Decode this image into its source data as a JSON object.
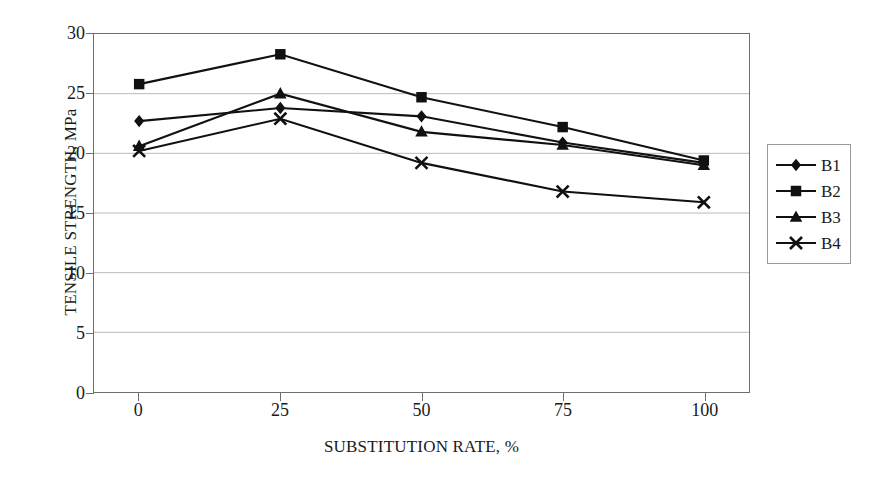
{
  "chart_data": {
    "type": "line",
    "title": "",
    "xlabel": "SUBSTITUTION RATE, %",
    "ylabel": "TENSILE STRENGTH, MPa",
    "x": [
      0,
      25,
      50,
      75,
      100
    ],
    "xticklabels": [
      "0",
      "25",
      "50",
      "75",
      "100"
    ],
    "yticklabels": [
      "0",
      "5",
      "10",
      "15",
      "20",
      "25",
      "30"
    ],
    "yticks": [
      0,
      5,
      10,
      15,
      20,
      25,
      30
    ],
    "xlim": [
      -8,
      108
    ],
    "ylim": [
      0,
      30
    ],
    "grid": "horizontal",
    "legend_position": "right-outside",
    "series": [
      {
        "name": "B1",
        "marker": "diamond",
        "values": [
          22.7,
          23.8,
          23.1,
          20.9,
          19.2
        ]
      },
      {
        "name": "B2",
        "marker": "square",
        "values": [
          25.8,
          28.3,
          24.7,
          22.2,
          19.4
        ]
      },
      {
        "name": "B3",
        "marker": "triangle",
        "values": [
          20.6,
          25.0,
          21.8,
          20.7,
          19.0
        ]
      },
      {
        "name": "B4",
        "marker": "cross",
        "values": [
          20.2,
          22.9,
          19.2,
          16.8,
          15.9
        ]
      }
    ],
    "colors": {
      "series_line": "#111111",
      "marker": "#111111",
      "grid": "#b9b9b9",
      "axis": "#6e6e6e",
      "background": "#ffffff",
      "text": "#1a1a1a"
    }
  }
}
